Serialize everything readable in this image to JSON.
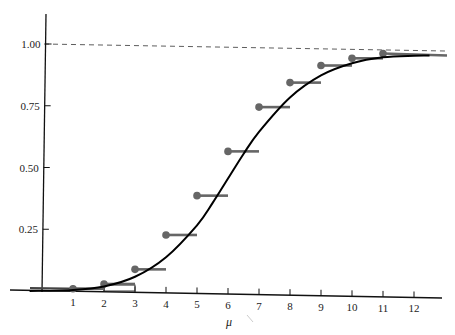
{
  "chart_data": {
    "type": "line",
    "title": "",
    "xlabel": "μ",
    "ylabel": "",
    "xlim": [
      -0.9,
      13
    ],
    "ylim": [
      0,
      1.05
    ],
    "grid": false,
    "legend": null,
    "x_ticks": [
      "1",
      "2",
      "3",
      "4",
      "5",
      "6",
      "7",
      "8",
      "9",
      "10",
      "11",
      "12"
    ],
    "y_ticks": [
      "0.25",
      "0.50",
      "0.75",
      "1.00"
    ],
    "reference_line": {
      "y": 1.0,
      "style": "dashed"
    },
    "series": [
      {
        "name": "step function (cumulative, dots at left end)",
        "style": "step",
        "color": "#666666",
        "x": [
          1,
          2,
          3,
          4,
          5,
          6,
          7,
          8,
          9,
          10,
          11
        ],
        "values": [
          0.01,
          0.03,
          0.09,
          0.23,
          0.39,
          0.57,
          0.75,
          0.85,
          0.92,
          0.95,
          0.97
        ]
      },
      {
        "name": "smooth S-curve",
        "style": "line",
        "color": "#000000",
        "x": [
          -0.4,
          1,
          2,
          3,
          4,
          5,
          5.5,
          6,
          6.5,
          7,
          8,
          9,
          10,
          11,
          12,
          12.5
        ],
        "values": [
          0.0,
          0.005,
          0.02,
          0.06,
          0.14,
          0.27,
          0.36,
          0.46,
          0.56,
          0.65,
          0.79,
          0.88,
          0.93,
          0.955,
          0.962,
          0.963
        ]
      }
    ],
    "annotations": []
  },
  "labels": {
    "x_axis": "μ",
    "x_ticks": [
      "1",
      "2",
      "3",
      "4",
      "5",
      "6",
      "7",
      "8",
      "9",
      "10",
      "11",
      "12"
    ],
    "y_ticks": [
      "0.25",
      "0.50",
      "0.75",
      "1.00"
    ]
  }
}
